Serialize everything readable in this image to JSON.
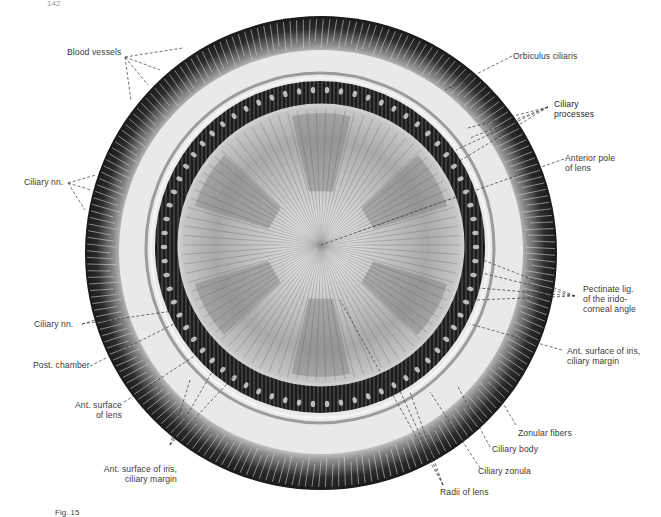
{
  "page": {
    "page_number": "142",
    "caption_fragment": "Fig. 15"
  },
  "figure": {
    "colors": {
      "background": "#ffffff",
      "outer_ring_dark": "#2a2a2a",
      "ciliary_light_band": "#e6e6e6",
      "iris_ring_dark": "#1c1c1c",
      "lens_light": "#d9d9d9",
      "lens_shadow": "#8e8e8e",
      "leader_line": "#3a3a3a",
      "label_text": "#3a3a3a"
    }
  },
  "labels": {
    "blood_vessels": "Blood vessels",
    "ciliary_nn_upper": "Ciliary nn.",
    "ciliary_nn_lower": "Ciliary nn.",
    "post_chamber": "Post. chamber",
    "ant_surface_lens_1": "Ant. surface",
    "ant_surface_lens_2": "of lens",
    "ant_surface_iris_left_1": "Ant. surface of iris,",
    "ant_surface_iris_left_2": "ciliary margin",
    "orbiculus_ciliaris": "Orbiculus ciliaris",
    "ciliary_processes_1": "Ciliary",
    "ciliary_processes_2": "processes",
    "anterior_pole_1": "Anterior pole",
    "anterior_pole_2": "of lens",
    "pectinate_1": "Pectinate lig.",
    "pectinate_2": "of the irido-",
    "pectinate_3": "corneal angle",
    "ant_surface_iris_right_1": "Ant. surface of iris,",
    "ant_surface_iris_right_2": "ciliary margin",
    "zonular_fibers": "Zonular fibers",
    "ciliary_body": "Ciliary body",
    "ciliary_zonula": "Ciliary zonula",
    "radii_of_lens": "Radii of lens"
  }
}
